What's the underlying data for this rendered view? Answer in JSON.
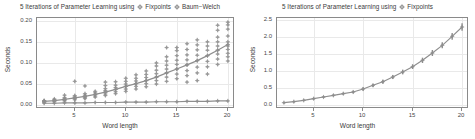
{
  "figure": {
    "width": 475,
    "height": 139,
    "background": "#ffffff",
    "axis_color": "#8a8a8a",
    "grid_color": "#e9e9e9",
    "series_color": "#8e8e8e",
    "text_color": "#3a3a3a"
  },
  "panels": {
    "left": {
      "title_prefix": "5 Iterations of Parameter Learning using",
      "legend": [
        {
          "label": "Fixpoints",
          "marker": "circle-plus-marker",
          "color": "#8e8e8e"
        },
        {
          "label": "Baum−Welch",
          "marker": "circle-plus-marker",
          "color": "#8e8e8e"
        }
      ],
      "xlabel": "Word length",
      "ylabel": "Seconds",
      "xticks": [
        5,
        10,
        15,
        20
      ],
      "xtick_labels": [
        "5",
        "10",
        "15",
        "20"
      ],
      "yticks": [
        0.0,
        0.05,
        0.1,
        0.15,
        0.2
      ],
      "ytick_labels": [
        "0.00",
        "0.05",
        "0.10",
        "0.15",
        "0.20"
      ],
      "xlim": [
        1.3,
        20.7
      ],
      "ylim": [
        -0.012,
        0.225
      ]
    },
    "right": {
      "title_prefix": "5 Iterations of Parameter Learning using",
      "legend": [
        {
          "label": "Fixpoints",
          "marker": "circle-plus-marker",
          "color": "#8e8e8e"
        }
      ],
      "xlabel": "Word length",
      "ylabel": "Seconds",
      "xticks": [
        5,
        10,
        15,
        20
      ],
      "xtick_labels": [
        "5",
        "10",
        "15",
        "20"
      ],
      "yticks": [
        0.0,
        0.5,
        1.0,
        1.5,
        2.0,
        2.5
      ],
      "ytick_labels": [
        "0.0",
        "0.5",
        "1.0",
        "1.5",
        "2.0",
        "2.5"
      ],
      "xlim": [
        1.3,
        20.7
      ],
      "ylim": [
        -0.13,
        2.6
      ]
    }
  },
  "chart_data": [
    {
      "type": "scatter",
      "panel": "left",
      "title": "5 Iterations of Parameter Learning using  Fixpoints  Baum−Welch",
      "xlabel": "Word length",
      "ylabel": "Seconds",
      "xlim": [
        1.3,
        20.7
      ],
      "ylim": [
        -0.012,
        0.225
      ],
      "grid": true,
      "legend_position": "title",
      "x": [
        2,
        3,
        4,
        5,
        6,
        7,
        8,
        9,
        10,
        11,
        12,
        13,
        14,
        15,
        16,
        17,
        18,
        19,
        20
      ],
      "series": [
        {
          "name": "Fixpoints",
          "kind": "mean-line",
          "values": [
            0.008,
            0.01,
            0.013,
            0.017,
            0.021,
            0.026,
            0.032,
            0.039,
            0.047,
            0.054,
            0.062,
            0.071,
            0.082,
            0.092,
            0.103,
            0.114,
            0.127,
            0.141,
            0.156
          ]
        },
        {
          "name": "Baum−Welch",
          "kind": "mean-line",
          "values": [
            0.003,
            0.003,
            0.004,
            0.004,
            0.004,
            0.005,
            0.005,
            0.005,
            0.006,
            0.006,
            0.006,
            0.007,
            0.007,
            0.007,
            0.008,
            0.008,
            0.008,
            0.009,
            0.009
          ]
        }
      ],
      "scatter_points": [
        {
          "x": 2,
          "y": [
            0.005,
            0.007,
            0.008,
            0.009,
            0.01
          ]
        },
        {
          "x": 3,
          "y": [
            0.007,
            0.009,
            0.011,
            0.012,
            0.014
          ]
        },
        {
          "x": 4,
          "y": [
            0.009,
            0.011,
            0.013,
            0.015,
            0.018,
            0.024
          ]
        },
        {
          "x": 5,
          "y": [
            0.012,
            0.015,
            0.017,
            0.02,
            0.023,
            0.06
          ]
        },
        {
          "x": 6,
          "y": [
            0.015,
            0.018,
            0.021,
            0.024,
            0.028,
            0.048
          ]
        },
        {
          "x": 7,
          "y": [
            0.019,
            0.022,
            0.026,
            0.03,
            0.034
          ]
        },
        {
          "x": 8,
          "y": [
            0.023,
            0.027,
            0.032,
            0.036,
            0.041,
            0.049,
            0.058
          ]
        },
        {
          "x": 9,
          "y": [
            0.028,
            0.033,
            0.039,
            0.044,
            0.05,
            0.059
          ]
        },
        {
          "x": 10,
          "y": [
            0.034,
            0.04,
            0.047,
            0.053,
            0.06,
            0.068
          ]
        },
        {
          "x": 11,
          "y": [
            0.04,
            0.047,
            0.054,
            0.061,
            0.068,
            0.077
          ]
        },
        {
          "x": 12,
          "y": [
            0.046,
            0.054,
            0.062,
            0.07,
            0.078,
            0.087
          ]
        },
        {
          "x": 13,
          "y": [
            0.053,
            0.062,
            0.071,
            0.08,
            0.089,
            0.1,
            0.108
          ]
        },
        {
          "x": 14,
          "y": [
            0.06,
            0.071,
            0.082,
            0.092,
            0.102,
            0.113,
            0.124,
            0.148
          ]
        },
        {
          "x": 15,
          "y": [
            0.067,
            0.079,
            0.092,
            0.104,
            0.115,
            0.127,
            0.14,
            0.148
          ]
        },
        {
          "x": 16,
          "y": [
            0.058,
            0.075,
            0.088,
            0.103,
            0.116,
            0.129,
            0.143,
            0.158
          ]
        },
        {
          "x": 17,
          "y": [
            0.062,
            0.082,
            0.097,
            0.114,
            0.128,
            0.142,
            0.155,
            0.168
          ]
        },
        {
          "x": 18,
          "y": [
            0.079,
            0.098,
            0.112,
            0.127,
            0.141,
            0.152,
            0.163
          ]
        },
        {
          "x": 19,
          "y": [
            0.104,
            0.118,
            0.131,
            0.141,
            0.152,
            0.163,
            0.175,
            0.193,
            0.206
          ]
        },
        {
          "x": 20,
          "y": [
            0.113,
            0.124,
            0.133,
            0.143,
            0.152,
            0.163,
            0.178,
            0.196,
            0.207,
            0.214
          ]
        }
      ]
    },
    {
      "type": "line",
      "panel": "right",
      "title": "5 Iterations of Parameter Learning using  Fixpoints",
      "xlabel": "Word length",
      "ylabel": "Seconds",
      "xlim": [
        1.3,
        20.7
      ],
      "ylim": [
        -0.13,
        2.6
      ],
      "grid": true,
      "legend_position": "title",
      "x": [
        2,
        3,
        4,
        5,
        6,
        7,
        8,
        9,
        10,
        11,
        12,
        13,
        14,
        15,
        16,
        17,
        18,
        19,
        20
      ],
      "series": [
        {
          "name": "Fixpoints",
          "kind": "mean-line-with-errorbars",
          "values": [
            0.06,
            0.09,
            0.13,
            0.18,
            0.23,
            0.28,
            0.33,
            0.38,
            0.47,
            0.58,
            0.69,
            0.83,
            0.98,
            1.14,
            1.33,
            1.55,
            1.78,
            2.05,
            2.33
          ],
          "err_low": [
            0.02,
            0.02,
            0.02,
            0.03,
            0.03,
            0.03,
            0.03,
            0.04,
            0.05,
            0.05,
            0.06,
            0.06,
            0.07,
            0.07,
            0.08,
            0.09,
            0.09,
            0.1,
            0.11
          ],
          "err_high": [
            0.02,
            0.02,
            0.02,
            0.03,
            0.03,
            0.03,
            0.03,
            0.04,
            0.05,
            0.05,
            0.06,
            0.06,
            0.07,
            0.07,
            0.08,
            0.09,
            0.09,
            0.1,
            0.11
          ]
        }
      ]
    }
  ]
}
